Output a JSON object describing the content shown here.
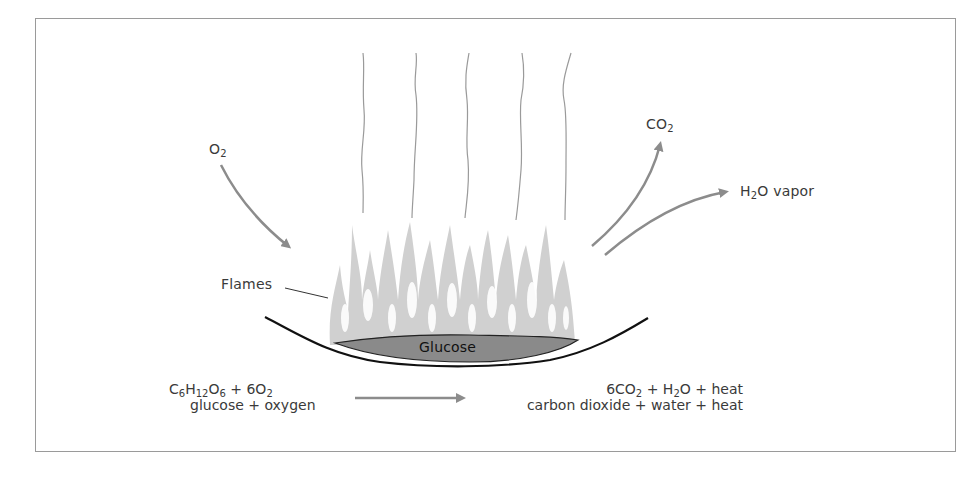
{
  "diagram": {
    "labels": {
      "oxygen_in": {
        "base": "O",
        "sub": "2"
      },
      "co2_out": {
        "base": "CO",
        "sub": "2"
      },
      "h2o_out": {
        "base": "H",
        "sub": "2",
        "rest": "O vapor"
      },
      "flames": "Flames",
      "glucose": "Glucose"
    },
    "equation": {
      "reactants_formula": {
        "c": "C",
        "c_sub": "6",
        "h": "H",
        "h_sub": "12",
        "o": "O",
        "o_sub": "6",
        "plus": " + 6O",
        "o2_sub": "2"
      },
      "reactants_words": "glucose + oxygen",
      "products_formula": {
        "p1": "6CO",
        "p1_sub": "2",
        "p2": " +  H",
        "p2_sub": "2",
        "p3": "O + heat"
      },
      "products_words": "carbon dioxide + water + heat"
    },
    "colors": {
      "frame": "#9a9a9a",
      "arrow": "#8c8c8c",
      "flame": "#cfcfcf",
      "glucose_fill": "#8a8a8a",
      "bowl": "#111111",
      "heat_lines": "#9a9a9a"
    }
  }
}
